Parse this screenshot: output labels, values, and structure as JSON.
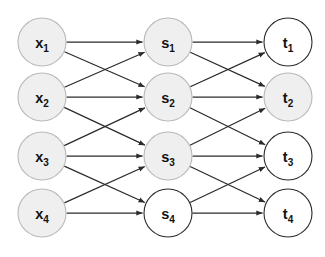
{
  "diagram": {
    "background_color": "#ffffff",
    "edge_color": "#2b2b2b",
    "gray_fill": "#efefef",
    "gray_stroke": "#b9b9b9",
    "white_fill": "#ffffff",
    "dark_stroke": "#2b2b2b",
    "node_radius": 24,
    "layers": [
      {
        "name": "input-layer",
        "x": 42,
        "nodes": [
          {
            "id": "x1",
            "base": "x",
            "sub": "1",
            "cy": 42,
            "fill": "gray"
          },
          {
            "id": "x2",
            "base": "x",
            "sub": "2",
            "cy": 97,
            "fill": "gray"
          },
          {
            "id": "x3",
            "base": "x",
            "sub": "3",
            "cy": 156,
            "fill": "gray"
          },
          {
            "id": "x4",
            "base": "x",
            "sub": "4",
            "cy": 213,
            "fill": "gray"
          }
        ]
      },
      {
        "name": "hidden-layer",
        "x": 168,
        "nodes": [
          {
            "id": "s1",
            "base": "s",
            "sub": "1",
            "cy": 42,
            "fill": "gray"
          },
          {
            "id": "s2",
            "base": "s",
            "sub": "2",
            "cy": 97,
            "fill": "gray"
          },
          {
            "id": "s3",
            "base": "s",
            "sub": "3",
            "cy": 156,
            "fill": "gray"
          },
          {
            "id": "s4",
            "base": "s",
            "sub": "4",
            "cy": 213,
            "fill": "white"
          }
        ]
      },
      {
        "name": "output-layer",
        "x": 288,
        "nodes": [
          {
            "id": "t1",
            "base": "t",
            "sub": "1",
            "cy": 42,
            "fill": "white"
          },
          {
            "id": "t2",
            "base": "t",
            "sub": "2",
            "cy": 97,
            "fill": "gray"
          },
          {
            "id": "t3",
            "base": "t",
            "sub": "3",
            "cy": 156,
            "fill": "white"
          },
          {
            "id": "t4",
            "base": "t",
            "sub": "4",
            "cy": 213,
            "fill": "white"
          }
        ]
      }
    ],
    "edges": [
      {
        "from": "x1",
        "to": "s1"
      },
      {
        "from": "x1",
        "to": "s2"
      },
      {
        "from": "x2",
        "to": "s1"
      },
      {
        "from": "x2",
        "to": "s2"
      },
      {
        "from": "x2",
        "to": "s3"
      },
      {
        "from": "x3",
        "to": "s2"
      },
      {
        "from": "x3",
        "to": "s3"
      },
      {
        "from": "x3",
        "to": "s4"
      },
      {
        "from": "x4",
        "to": "s3"
      },
      {
        "from": "x4",
        "to": "s4"
      },
      {
        "from": "s1",
        "to": "t1"
      },
      {
        "from": "s1",
        "to": "t2"
      },
      {
        "from": "s2",
        "to": "t1"
      },
      {
        "from": "s2",
        "to": "t2"
      },
      {
        "from": "s2",
        "to": "t3"
      },
      {
        "from": "s3",
        "to": "t2"
      },
      {
        "from": "s3",
        "to": "t3"
      },
      {
        "from": "s3",
        "to": "t4"
      },
      {
        "from": "s4",
        "to": "t3"
      },
      {
        "from": "s4",
        "to": "t4"
      }
    ]
  }
}
